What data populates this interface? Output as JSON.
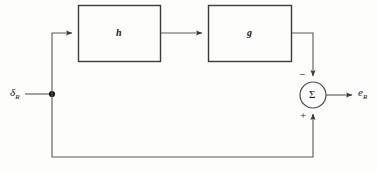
{
  "diagram": {
    "type": "block-diagram",
    "blocks": [
      {
        "id": "h",
        "label": "h",
        "x": 78,
        "y": 5,
        "width": 83,
        "height": 57
      },
      {
        "id": "g",
        "label": "g",
        "x": 208,
        "y": 5,
        "width": 84,
        "height": 57
      }
    ],
    "summing_junction": {
      "label": "Σ",
      "cx": 313,
      "cy": 95,
      "r": 13,
      "minus_sign": "−",
      "plus_sign": "+"
    },
    "io": {
      "input_label": "δ",
      "input_subscript": "R",
      "output_label": "e",
      "output_subscript": "R"
    },
    "junction_dot": {
      "x": 52,
      "y": 94,
      "r": 3
    },
    "stroke_color": "#3b3b3b",
    "ink_color": "#151515",
    "background_color": "#fdfdfc"
  }
}
